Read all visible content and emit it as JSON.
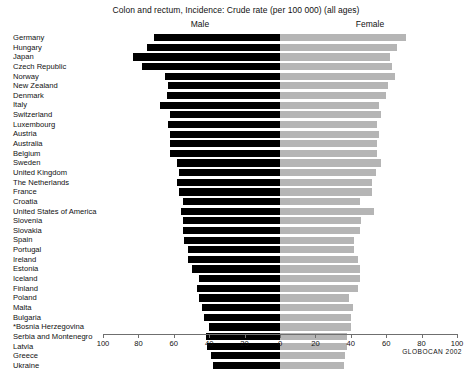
{
  "chart_data": {
    "type": "bar",
    "orientation": "horizontal",
    "style": "population-pyramid",
    "title": "Colon and rectum, Incidence: Crude rate (per 100 000) (all ages)",
    "xlabel": "",
    "ylabel": "",
    "xlim": [
      -100,
      100
    ],
    "xticks": [
      -100,
      -80,
      -60,
      -40,
      -20,
      0,
      20,
      40,
      60,
      80,
      100
    ],
    "xticklabels": [
      "100",
      "80",
      "60",
      "40",
      "20",
      "0",
      "20",
      "40",
      "60",
      "80",
      "100"
    ],
    "grid": false,
    "legend_position": "top",
    "source_note": "GLOBOCAN 2002",
    "panel_labels": {
      "left": "Male",
      "right": "Female"
    },
    "series": [
      {
        "name": "Male",
        "color": "#000000",
        "side": "left"
      },
      {
        "name": "Female",
        "color": "#b5b5b5",
        "side": "right"
      }
    ],
    "categories": [
      "Germany",
      "Hungary",
      "Japan",
      "Czech Republic",
      "Norway",
      "New Zealand",
      "Denmark",
      "Italy",
      "Switzerland",
      "Luxembourg",
      "Austria",
      "Australia",
      "Belgium",
      "Sweden",
      "United Kingdom",
      "The Netherlands",
      "France",
      "Croatia",
      "United States of America",
      "Slovenia",
      "Slovakia",
      "Spain",
      "Portugal",
      "Ireland",
      "Estonia",
      "Iceland",
      "Finland",
      "Poland",
      "Malta",
      "Bulgaria",
      "*Bosnia Herzegovina",
      "Serbia and Montenegro",
      "Latvia",
      "Greece",
      "Ukraine"
    ],
    "values": {
      "Male": [
        71,
        75,
        83,
        78,
        65,
        63,
        64,
        68,
        62,
        63,
        62,
        62,
        62,
        58,
        57,
        58,
        57,
        55,
        56,
        55,
        55,
        54,
        52,
        52,
        50,
        46,
        47,
        46,
        44,
        43,
        40,
        42,
        41,
        39,
        38
      ],
      "Female": [
        71,
        66,
        62,
        63,
        65,
        61,
        60,
        56,
        57,
        55,
        56,
        55,
        55,
        57,
        54,
        52,
        52,
        45,
        53,
        46,
        45,
        42,
        42,
        44,
        45,
        45,
        44,
        39,
        41,
        40,
        40,
        38,
        38,
        37,
        36
      ]
    }
  }
}
